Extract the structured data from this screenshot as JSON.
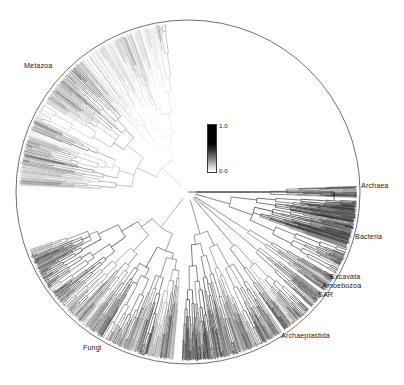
{
  "figure": {
    "type": "circular-phylogenetic-tree",
    "title": "",
    "background_color": "#ffffff",
    "geometry": {
      "center_x": 188,
      "center_y": 192,
      "outer_radius": 170,
      "root_radius": 8,
      "root_angle_deg": 0
    }
  },
  "colorbar": {
    "name": "branch-support-colorbar",
    "orientation": "vertical",
    "top_label": "1.0",
    "bottom_label": "0.0",
    "min": 0.0,
    "max": 1.0,
    "top_color": "#000000",
    "bottom_color": "#ffffff",
    "x": 207,
    "y": 124,
    "width": 10,
    "height": 49
  },
  "clade_labels": [
    {
      "name": "label-metazoa",
      "text": "Metazoa",
      "x": 24,
      "y": 66,
      "align": "left",
      "angle_deg": 140
    },
    {
      "name": "label-archaea",
      "text": "Archaea",
      "x": 361,
      "y": 186,
      "align": "left",
      "angle_deg": 2
    },
    {
      "name": "label-bacteria",
      "text": "Bacteria",
      "x": 355,
      "y": 237,
      "align": "left",
      "angle_deg": 342
    },
    {
      "name": "label-excavata",
      "text": "Excavata",
      "x": 330,
      "y": 277,
      "align": "left",
      "angle_deg": 325
    },
    {
      "name": "label-amoebozoa",
      "text": "Amoebozoa",
      "x": 322,
      "y": 286,
      "align": "left",
      "angle_deg": 320
    },
    {
      "name": "label-sar",
      "text": "SAR",
      "x": 318,
      "y": 295,
      "align": "left",
      "angle_deg": 316
    },
    {
      "name": "label-archaeplastida",
      "text": "Archaeplastida",
      "x": 281,
      "y": 336,
      "align": "left",
      "angle_deg": 300
    },
    {
      "name": "label-fungi",
      "text": "Fungi",
      "x": 83,
      "y": 348,
      "align": "left",
      "angle_deg": 250
    }
  ],
  "chart_data": {
    "type": "tree",
    "title": "",
    "xlabel": "",
    "ylabel": "",
    "colorbar_label": "",
    "color_scale": {
      "min": 0.0,
      "max": 1.0,
      "low_color": "#ffffff",
      "high_color": "#000000"
    },
    "clades": [
      {
        "label": "Metazoa",
        "start_angle_deg": 97,
        "end_angle_deg": 178,
        "mean_support": 0.22,
        "tip_count": 260
      },
      {
        "label": "Fungi",
        "start_angle_deg": 200,
        "end_angle_deg": 265,
        "mean_support": 0.55,
        "tip_count": 230
      },
      {
        "label": "Archaeplastida",
        "start_angle_deg": 268,
        "end_angle_deg": 304,
        "mean_support": 0.62,
        "tip_count": 150
      },
      {
        "label": "SAR",
        "start_angle_deg": 305,
        "end_angle_deg": 316,
        "mean_support": 0.7,
        "tip_count": 55
      },
      {
        "label": "Amoebozoa",
        "start_angle_deg": 317,
        "end_angle_deg": 323,
        "mean_support": 0.68,
        "tip_count": 26
      },
      {
        "label": "Excavata",
        "start_angle_deg": 324,
        "end_angle_deg": 330,
        "mean_support": 0.66,
        "tip_count": 24
      },
      {
        "label": "Bacteria",
        "start_angle_deg": 331,
        "end_angle_deg": 357,
        "mean_support": 0.8,
        "tip_count": 150
      },
      {
        "label": "Archaea",
        "start_angle_deg": 358,
        "end_angle_deg": 362,
        "mean_support": 0.85,
        "tip_count": 22
      }
    ]
  }
}
